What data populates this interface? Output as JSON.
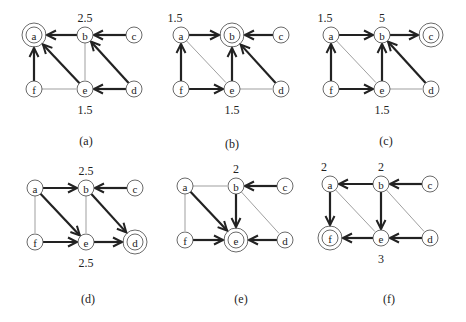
{
  "figure": {
    "node_layout": {
      "a": [
        0,
        0
      ],
      "b": [
        51,
        0
      ],
      "c": [
        100,
        0
      ],
      "f": [
        0,
        54
      ],
      "e": [
        51,
        54
      ],
      "d": [
        100,
        54
      ]
    },
    "panels": [
      {
        "id": "a",
        "caption": "(a)",
        "origin": [
          34,
          35
        ],
        "caption_pos": [
          86,
          141
        ],
        "target": "a",
        "edges": [
          {
            "from": "b",
            "to": "a",
            "style": "thick"
          },
          {
            "from": "c",
            "to": "b",
            "style": "thick"
          },
          {
            "from": "f",
            "to": "a",
            "style": "thick"
          },
          {
            "from": "e",
            "to": "a",
            "style": "thick"
          },
          {
            "from": "d",
            "to": "b",
            "style": "thick"
          },
          {
            "from": "d",
            "to": "e",
            "style": "thick"
          },
          {
            "from": "b",
            "to": "e",
            "style": "thin"
          },
          {
            "from": "f",
            "to": "e",
            "style": "thin"
          }
        ],
        "labels": [
          {
            "text": "2.5",
            "node": "b",
            "pos": "above"
          },
          {
            "text": "1.5",
            "node": "e",
            "pos": "below"
          }
        ]
      },
      {
        "id": "b",
        "caption": "(b)",
        "origin": [
          181,
          35
        ],
        "caption_pos": [
          232,
          144
        ],
        "target": "b",
        "edges": [
          {
            "from": "a",
            "to": "b",
            "style": "thick"
          },
          {
            "from": "c",
            "to": "b",
            "style": "thick"
          },
          {
            "from": "f",
            "to": "a",
            "style": "thick"
          },
          {
            "from": "e",
            "to": "b",
            "style": "thick"
          },
          {
            "from": "d",
            "to": "b",
            "style": "thick"
          },
          {
            "from": "f",
            "to": "e",
            "style": "thick"
          },
          {
            "from": "a",
            "to": "e",
            "style": "thin"
          },
          {
            "from": "e",
            "to": "d",
            "style": "thin"
          }
        ],
        "labels": [
          {
            "text": "1.5",
            "node": "a",
            "pos": "above-left"
          },
          {
            "text": "1.5",
            "node": "e",
            "pos": "below"
          }
        ]
      },
      {
        "id": "c",
        "caption": "(c)",
        "origin": [
          331,
          35
        ],
        "caption_pos": [
          386,
          141
        ],
        "target": "c",
        "edges": [
          {
            "from": "a",
            "to": "b",
            "style": "thick"
          },
          {
            "from": "b",
            "to": "c",
            "style": "thick"
          },
          {
            "from": "f",
            "to": "a",
            "style": "thick"
          },
          {
            "from": "e",
            "to": "b",
            "style": "thick"
          },
          {
            "from": "d",
            "to": "b",
            "style": "thick"
          },
          {
            "from": "f",
            "to": "e",
            "style": "thick"
          },
          {
            "from": "a",
            "to": "e",
            "style": "thin"
          },
          {
            "from": "e",
            "to": "d",
            "style": "thin"
          }
        ],
        "labels": [
          {
            "text": "1.5",
            "node": "a",
            "pos": "above-left"
          },
          {
            "text": "5",
            "node": "b",
            "pos": "above"
          },
          {
            "text": "1.5",
            "node": "e",
            "pos": "below"
          }
        ]
      },
      {
        "id": "d",
        "caption": "(d)",
        "origin": [
          35,
          188
        ],
        "caption_pos": [
          88,
          299
        ],
        "target": "d",
        "edges": [
          {
            "from": "a",
            "to": "b",
            "style": "thick"
          },
          {
            "from": "c",
            "to": "b",
            "style": "thick"
          },
          {
            "from": "a",
            "to": "e",
            "style": "thick"
          },
          {
            "from": "b",
            "to": "d",
            "style": "thick"
          },
          {
            "from": "f",
            "to": "e",
            "style": "thick"
          },
          {
            "from": "e",
            "to": "d",
            "style": "thick"
          },
          {
            "from": "a",
            "to": "f",
            "style": "thin"
          },
          {
            "from": "b",
            "to": "e",
            "style": "thin"
          }
        ],
        "labels": [
          {
            "text": "2.5",
            "node": "b",
            "pos": "above"
          },
          {
            "text": "2.5",
            "node": "e",
            "pos": "below"
          }
        ]
      },
      {
        "id": "e",
        "caption": "(e)",
        "origin": [
          185,
          186
        ],
        "caption_pos": [
          241,
          299
        ],
        "target": "e",
        "edges": [
          {
            "from": "c",
            "to": "b",
            "style": "thick"
          },
          {
            "from": "a",
            "to": "e",
            "style": "thick"
          },
          {
            "from": "b",
            "to": "e",
            "style": "thick"
          },
          {
            "from": "f",
            "to": "e",
            "style": "thick"
          },
          {
            "from": "d",
            "to": "e",
            "style": "thick"
          },
          {
            "from": "a",
            "to": "b",
            "style": "thin"
          },
          {
            "from": "a",
            "to": "f",
            "style": "thin"
          },
          {
            "from": "b",
            "to": "d",
            "style": "thin"
          }
        ],
        "labels": [
          {
            "text": "2",
            "node": "b",
            "pos": "above"
          }
        ]
      },
      {
        "id": "f",
        "caption": "(f)",
        "origin": [
          330,
          184
        ],
        "caption_pos": [
          389,
          299
        ],
        "target": "f",
        "edges": [
          {
            "from": "b",
            "to": "a",
            "style": "thick"
          },
          {
            "from": "c",
            "to": "b",
            "style": "thick"
          },
          {
            "from": "a",
            "to": "f",
            "style": "thick"
          },
          {
            "from": "b",
            "to": "e",
            "style": "thick"
          },
          {
            "from": "e",
            "to": "f",
            "style": "thick"
          },
          {
            "from": "d",
            "to": "e",
            "style": "thick"
          },
          {
            "from": "a",
            "to": "e",
            "style": "thin"
          },
          {
            "from": "b",
            "to": "d",
            "style": "thin"
          }
        ],
        "labels": [
          {
            "text": "2",
            "node": "a",
            "pos": "above-left"
          },
          {
            "text": "2",
            "node": "b",
            "pos": "above"
          },
          {
            "text": "3",
            "node": "e",
            "pos": "below"
          }
        ]
      }
    ]
  }
}
